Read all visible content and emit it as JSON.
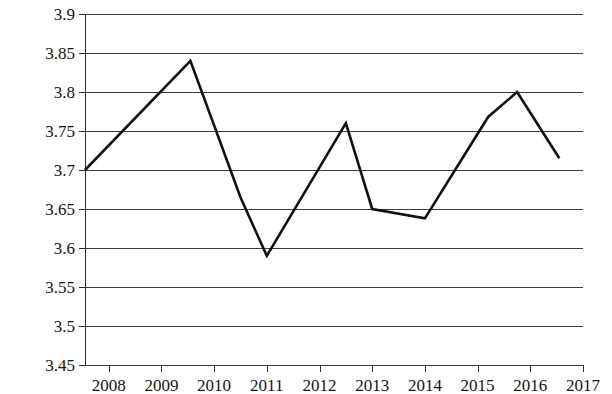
{
  "chart_data": {
    "type": "line",
    "title": "",
    "subtitle": "",
    "xlabel": "",
    "ylabel": "",
    "grid": true,
    "legend": null,
    "legend_position": "none",
    "line_color": "#111111",
    "grid_color": "#3b3b3b",
    "axis_color": "#2b2b2b",
    "xlim": [
      2007.55,
      2017.0
    ],
    "ylim": [
      3.45,
      3.9
    ],
    "x_tick_labels": [
      "2008",
      "2009",
      "2010",
      "2011",
      "2012",
      "2013",
      "2014",
      "2015",
      "2016",
      "2017"
    ],
    "x_ticks": [
      2008,
      2009,
      2010,
      2011,
      2012,
      2013,
      2014,
      2015,
      2016,
      2017
    ],
    "y_tick_labels": [
      "3.9",
      "3.85",
      "3.8",
      "3.75",
      "3.7",
      "3.65",
      "3.6",
      "3.55",
      "3.5",
      "3.45"
    ],
    "y_ticks": [
      3.9,
      3.85,
      3.8,
      3.75,
      3.7,
      3.65,
      3.6,
      3.55,
      3.5,
      3.45
    ],
    "series": [
      {
        "name": "series-1",
        "x": [
          2007.55,
          2009.55,
          2010.5,
          2011.0,
          2012.5,
          2013.0,
          2014.0,
          2015.2,
          2015.75,
          2016.55
        ],
        "values": [
          3.7,
          3.84,
          3.665,
          3.59,
          3.76,
          3.65,
          3.638,
          3.768,
          3.8,
          3.715
        ]
      }
    ]
  }
}
